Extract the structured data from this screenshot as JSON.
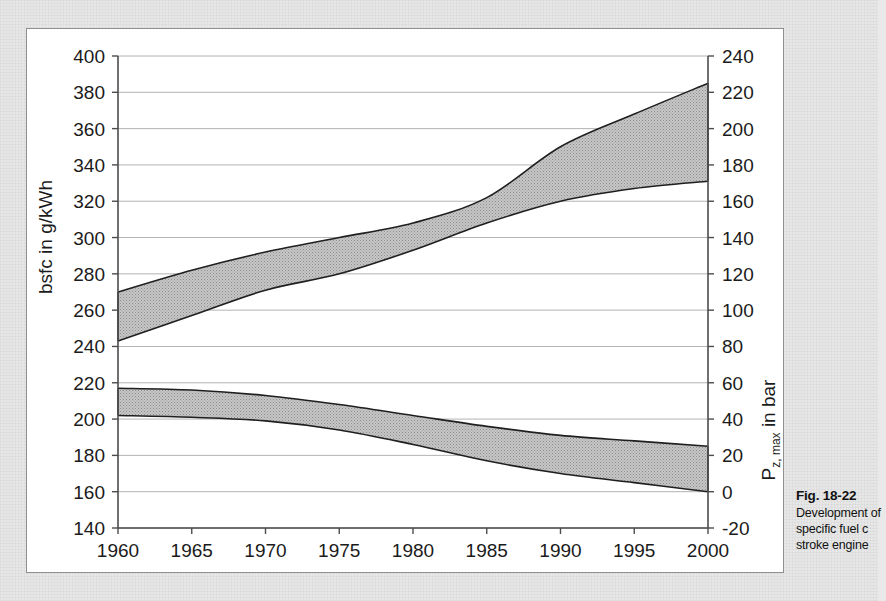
{
  "figure": {
    "caption_label": "Fig. 18-22",
    "caption_lines": [
      "Development of",
      "specific fuel c",
      "stroke engine"
    ]
  },
  "chart_data": {
    "type": "area",
    "title": "",
    "xlabel": "",
    "ylabel": "bsfc in g/kWh",
    "y2label_main": "P",
    "y2label_sub": "z, max",
    "y2label_tail": " in bar",
    "grid": true,
    "legend": "none",
    "x": [
      1960,
      1965,
      1970,
      1975,
      1980,
      1985,
      1990,
      1995,
      2000
    ],
    "xticks": [
      "1960",
      "1965",
      "1970",
      "1975",
      "1980",
      "1985",
      "1990",
      "1995",
      "2000"
    ],
    "xlim": [
      1960,
      2000
    ],
    "ylim": [
      140,
      400
    ],
    "yticks": [
      "400",
      "380",
      "360",
      "340",
      "320",
      "300",
      "280",
      "260",
      "240",
      "220",
      "200",
      "180",
      "160",
      "140"
    ],
    "y2lim": [
      -20,
      240
    ],
    "y2ticks": [
      "240",
      "220",
      "200",
      "180",
      "160",
      "140",
      "120",
      "100",
      "80",
      "60",
      "40",
      "20",
      "0",
      "-20"
    ],
    "series": [
      {
        "name": "Peak cylinder pressure band (upper band, right scale P z,max in bar)",
        "axis": "right",
        "upper_left_scale": [
          270,
          282,
          292,
          300,
          308,
          322,
          350,
          368,
          385
        ],
        "lower_left_scale": [
          243,
          257,
          271,
          280,
          293,
          308,
          320,
          327,
          331
        ],
        "upper_right_scale": [
          110,
          122,
          132,
          140,
          148,
          162,
          190,
          208,
          225
        ],
        "lower_right_scale": [
          83,
          97,
          111,
          120,
          133,
          148,
          160,
          167,
          171
        ]
      },
      {
        "name": "Specific fuel consumption band (lower band, left scale bsfc in g/kWh)",
        "axis": "left",
        "upper_left_scale": [
          217,
          216,
          213,
          208,
          202,
          196,
          191,
          188,
          185
        ],
        "lower_left_scale": [
          202,
          201,
          199,
          194,
          186,
          177,
          170,
          165,
          160
        ],
        "upper_right_scale": [
          57,
          56,
          53,
          48,
          42,
          36,
          31,
          28,
          25
        ],
        "lower_right_scale": [
          42,
          41,
          39,
          34,
          26,
          17,
          10,
          5,
          0
        ]
      }
    ]
  },
  "style": {
    "band_fill": "#b9b9b9",
    "band_stroke": "#1f1f1f",
    "grid_color": "#9a9a9a",
    "axis_color": "#4c4c4c",
    "panel_bg": "#ffffff",
    "page_bg": "#e7e7e7"
  }
}
